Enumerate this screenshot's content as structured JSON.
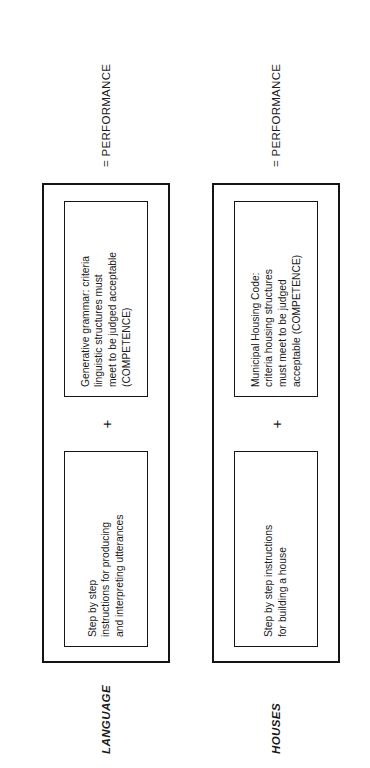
{
  "figure": {
    "orientation_note": "rotated",
    "rows": [
      {
        "label": "LANGUAGE",
        "left_box": "Step by step\ninstructions for producing\nand interpreting utterances",
        "plus": "+",
        "right_box": "Generative grammar: criteria\nlinguistic structures must\nmeet to be judged acceptable\n(COMPETENCE)",
        "result": "= PERFORMANCE"
      },
      {
        "label": "HOUSES",
        "left_box": "Step by step instructions\nfor building a house",
        "plus": "+",
        "right_box": "Municipal Housing Code:\ncriteria housing structures\nmust meet to be judged\nacceptable (COMPETENCE)",
        "result": "= PERFORMANCE"
      }
    ]
  }
}
